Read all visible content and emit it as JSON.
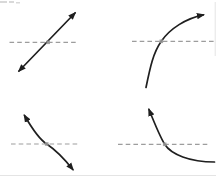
{
  "canvas": {
    "width": 216,
    "height": 182,
    "background": "#ffffff"
  },
  "colors": {
    "curve": "#1f1f1f",
    "dashed": "#9d9d9d",
    "dot": "#979797",
    "smudge": "#d9d9d9",
    "faint_rule": "#e4e4e4"
  },
  "figure": {
    "panels": [
      {
        "id": "top-left",
        "shape": "straight line",
        "description": "Straight line with constant positive slope, arrowheads at both ends, crossing the dashed line at the marked point",
        "path": "M 19,71 L 75,13",
        "arrow_start": true,
        "arrow_end": true,
        "dashed": {
          "x1": 9.5,
          "x2": 77.5,
          "y": 42.3
        },
        "point": {
          "x": 48.2,
          "y": 42.3
        }
      },
      {
        "id": "top-right",
        "shape": "increasing concave-down curve",
        "description": "Rising curve, steep at the bottom and flattening toward the upper right, arrowhead at upper right only, crossing the dashed line at the marked point",
        "path": "M 146,87.5 C 150,68 153,53 161.3,41.3 C 170,28.5 186,18.5 203.3,14.9",
        "arrow_start": false,
        "arrow_end": true,
        "dashed": {
          "x1": 132,
          "x2": 215,
          "y": 41.3
        },
        "point": {
          "x": 161.3,
          "y": 41.3
        }
      },
      {
        "id": "bottom-left",
        "shape": "decreasing s-curve",
        "description": "Falling S-shaped curve, steep at both ends and shallow at the middle inflection where it crosses the dashed line, arrowheads at both ends",
        "path": "M 24.5,115.5 C 30,125 38,138.5 46.7,144 C 55,149.5 64.5,159 72.8,169.5",
        "arrow_start": true,
        "arrow_end": true,
        "dashed": {
          "x1": 11,
          "x2": 79,
          "y": 144
        },
        "point": {
          "x": 46.7,
          "y": 144
        }
      },
      {
        "id": "bottom-right",
        "shape": "decreasing concave-up curve",
        "description": "Falling curve, steep at the upper left and flattening toward the lower right, arrowhead at upper left only, crossing the dashed line at the marked point",
        "path": "M 149,109.5 C 154,122 159.5,136 164.7,144.3 C 171,154.5 190,162 214.5,162",
        "arrow_start": true,
        "arrow_end": false,
        "dashed": {
          "x1": 118,
          "x2": 208,
          "y": 144.3
        },
        "point": {
          "x": 164.7,
          "y": 144.3
        }
      }
    ],
    "artifacts": {
      "corner_smudges": [
        {
          "x": 0,
          "y": 1,
          "w": 7,
          "h": 2
        },
        {
          "x": 9,
          "y": 1,
          "w": 5,
          "h": 2
        },
        {
          "x": 16,
          "y": 2,
          "w": 4,
          "h": 1.5
        }
      ],
      "faint_lines": [
        {
          "x1": 0,
          "y1": 175.5,
          "x2": 216,
          "y2": 175.5
        },
        {
          "x1": 215.2,
          "y1": 2,
          "x2": 215.2,
          "y2": 56
        }
      ]
    }
  }
}
